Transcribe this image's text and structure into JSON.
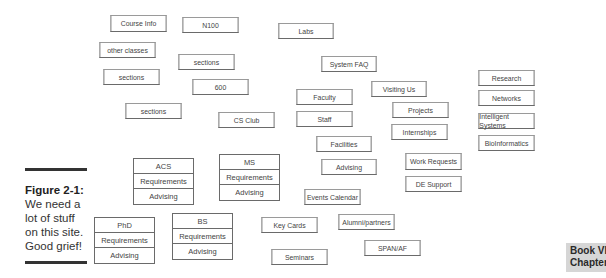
{
  "boxes": [
    {
      "id": "course-info",
      "label": "Course Info",
      "x": 108,
      "y": 15,
      "w": 61,
      "h": 17
    },
    {
      "id": "n100",
      "label": "N100",
      "x": 180,
      "y": 17,
      "w": 61,
      "h": 16
    },
    {
      "id": "labs",
      "label": "Labs",
      "x": 276,
      "y": 23,
      "w": 60,
      "h": 16
    },
    {
      "id": "other-classes",
      "label": "other classes",
      "x": 97,
      "y": 42,
      "w": 61,
      "h": 16
    },
    {
      "id": "sections-1",
      "label": "sections",
      "x": 176,
      "y": 54,
      "w": 61,
      "h": 16
    },
    {
      "id": "system-faq",
      "label": "System FAQ",
      "x": 319,
      "y": 56,
      "w": 60,
      "h": 16
    },
    {
      "id": "sections-2",
      "label": "sections",
      "x": 101,
      "y": 69,
      "w": 61,
      "h": 16
    },
    {
      "id": "600",
      "label": "600",
      "x": 190,
      "y": 79,
      "w": 61,
      "h": 16
    },
    {
      "id": "research",
      "label": "Research",
      "x": 476,
      "y": 70,
      "w": 61,
      "h": 16
    },
    {
      "id": "visiting-us",
      "label": "Visiting Us",
      "x": 369,
      "y": 81,
      "w": 60,
      "h": 16
    },
    {
      "id": "faculty",
      "label": "Faculty",
      "x": 294,
      "y": 89,
      "w": 61,
      "h": 16
    },
    {
      "id": "networks",
      "label": "Networks",
      "x": 476,
      "y": 90,
      "w": 61,
      "h": 16
    },
    {
      "id": "projects",
      "label": "Projects",
      "x": 390,
      "y": 102,
      "w": 61,
      "h": 16
    },
    {
      "id": "sections-3",
      "label": "sections",
      "x": 123,
      "y": 103,
      "w": 61,
      "h": 16
    },
    {
      "id": "cs-club",
      "label": "CS Club",
      "x": 216,
      "y": 112,
      "w": 61,
      "h": 16
    },
    {
      "id": "staff",
      "label": "Staff",
      "x": 294,
      "y": 111,
      "w": 61,
      "h": 16
    },
    {
      "id": "intelligent-systems",
      "label": "Intelligent Systems",
      "x": 476,
      "y": 113,
      "w": 61,
      "h": 16
    },
    {
      "id": "internships",
      "label": "Internships",
      "x": 389,
      "y": 124,
      "w": 61,
      "h": 16
    },
    {
      "id": "bioinformatics",
      "label": "BioInformatics",
      "x": 476,
      "y": 135,
      "w": 61,
      "h": 16
    },
    {
      "id": "facilities",
      "label": "Facilities",
      "x": 314,
      "y": 136,
      "w": 60,
      "h": 16
    },
    {
      "id": "advising",
      "label": "Advising",
      "x": 319,
      "y": 159,
      "w": 60,
      "h": 16
    },
    {
      "id": "work-requests",
      "label": "Work Requests",
      "x": 403,
      "y": 153,
      "w": 61,
      "h": 17
    },
    {
      "id": "de-support",
      "label": "DE Support",
      "x": 403,
      "y": 176,
      "w": 61,
      "h": 16
    },
    {
      "id": "events-calendar",
      "label": "Events Calendar",
      "x": 302,
      "y": 189,
      "w": 61,
      "h": 16
    },
    {
      "id": "key-cards",
      "label": "Key Cards",
      "x": 259,
      "y": 217,
      "w": 61,
      "h": 16
    },
    {
      "id": "alumni-partners",
      "label": "Alumni/partners",
      "x": 336,
      "y": 214,
      "w": 61,
      "h": 16
    },
    {
      "id": "span-af",
      "label": "SPAN/AF",
      "x": 362,
      "y": 240,
      "w": 61,
      "h": 16
    },
    {
      "id": "seminars",
      "label": "Seminars",
      "x": 269,
      "y": 249,
      "w": 61,
      "h": 16
    }
  ],
  "stacks": [
    {
      "id": "acs",
      "x": 133,
      "y": 158,
      "w": 61,
      "cells": [
        "ACS",
        "Requirements",
        "Advising"
      ]
    },
    {
      "id": "ms",
      "x": 219,
      "y": 154,
      "w": 61,
      "cells": [
        "MS",
        "Requirements",
        "Advising"
      ]
    },
    {
      "id": "phd",
      "x": 94,
      "y": 217,
      "w": 61,
      "cells": [
        "PhD",
        "Requirements",
        "Advising"
      ]
    },
    {
      "id": "bs",
      "x": 172,
      "y": 213,
      "w": 61,
      "cells": [
        "BS",
        "Requirements",
        "Advising"
      ]
    }
  ],
  "caption": {
    "title": "Figure 2-1:",
    "lines": [
      "We need a",
      "lot of stuff",
      "on this site.",
      "Good grief!"
    ]
  },
  "tab": {
    "line1": "Book VIII",
    "line2": "Chapter 2"
  }
}
